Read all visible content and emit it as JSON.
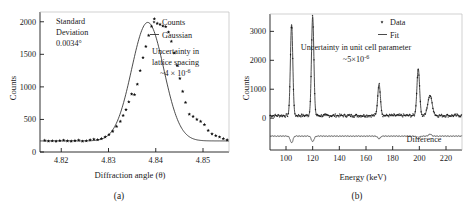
{
  "figure": {
    "panels": [
      {
        "caption": "(a)",
        "annotations": [
          {
            "name": "standard-deviation",
            "lines": [
              "Standard",
              "Deviation",
              "0.0034°"
            ]
          },
          {
            "name": "lattice-uncertainty",
            "lines": [
              "Uncertainty in",
              "lattice spacing",
              "~4 × 10",
              "-6"
            ]
          }
        ],
        "legend": [
          {
            "label": "Counts",
            "marker": "points"
          },
          {
            "label": "Gaussian",
            "marker": "line"
          }
        ]
      },
      {
        "caption": "(b)",
        "annotations": [
          {
            "name": "cell-uncertainty",
            "lines": [
              "Uncertainty in unit cell parameter",
              "~5×10",
              "-6"
            ]
          },
          {
            "name": "difference-label",
            "lines": [
              "Difference"
            ]
          }
        ],
        "legend": [
          {
            "label": "Data",
            "marker": "points"
          },
          {
            "label": "Fit",
            "marker": "line"
          }
        ]
      }
    ]
  },
  "chart_data": [
    {
      "type": "scatter",
      "panel": "(a)",
      "title": "",
      "xlabel": "Diffraction angle (θ)",
      "ylabel": "Counts",
      "xlim": [
        4.8155,
        4.8555
      ],
      "ylim": [
        0,
        2150
      ],
      "xticks": [
        4.82,
        4.83,
        4.84,
        4.85
      ],
      "xticklabels": [
        "4.82",
        "4.83",
        "4.84",
        "4.85"
      ],
      "yticks": [
        0,
        500,
        1000,
        1500,
        2000
      ],
      "yticklabels": [
        "0",
        "500",
        "1000",
        "1500",
        "2000"
      ],
      "grid": false,
      "legend_position": "top-right",
      "series": [
        {
          "name": "Counts",
          "style": "points",
          "x": [
            4.8165,
            4.8173,
            4.8181,
            4.8189,
            4.8197,
            4.8205,
            4.8213,
            4.8221,
            4.8229,
            4.8237,
            4.8245,
            4.8253,
            4.8261,
            4.8269,
            4.8277,
            4.8285,
            4.8293,
            4.8301,
            4.8309,
            4.8317,
            4.8325,
            4.8331,
            4.8337,
            4.8343,
            4.8349,
            4.8355,
            4.8361,
            4.8367,
            4.8373,
            4.8379,
            4.8385,
            4.8391,
            4.8397,
            4.8403,
            4.8409,
            4.8415,
            4.8421,
            4.8427,
            4.8433,
            4.8439,
            4.8445,
            4.8451,
            4.8457,
            4.8463,
            4.8471,
            4.8479,
            4.8487,
            4.8495,
            4.8503,
            4.8511,
            4.8519,
            4.8527,
            4.8535,
            4.8543,
            4.8551
          ],
          "y": [
            178,
            168,
            172,
            165,
            175,
            180,
            170,
            166,
            174,
            182,
            165,
            172,
            186,
            196,
            188,
            205,
            232,
            268,
            318,
            392,
            470,
            560,
            650,
            770,
            890,
            880,
            1040,
            1250,
            1450,
            1620,
            1790,
            1930,
            2045,
            1975,
            1960,
            1935,
            1925,
            1840,
            1700,
            1520,
            1330,
            1130,
            930,
            760,
            580,
            545,
            500,
            470,
            420,
            330,
            278,
            250,
            230,
            205,
            185
          ]
        },
        {
          "name": "Gaussian",
          "style": "line",
          "baseline": 170,
          "amplitude": 1820,
          "center": 4.8383,
          "sigma": 0.0034
        }
      ]
    },
    {
      "type": "line",
      "panel": "(b)",
      "title": "",
      "xlabel": "Energy (keV)",
      "ylabel": "Counts",
      "xlim": [
        88,
        232
      ],
      "ylim": [
        -1100,
        3600
      ],
      "xticks": [
        100,
        120,
        140,
        160,
        180,
        200,
        220
      ],
      "xticklabels": [
        "100",
        "120",
        "140",
        "160",
        "180",
        "200",
        "220"
      ],
      "yticks": [
        0,
        1000,
        2000,
        3000
      ],
      "yticklabels": [
        "0",
        "1000",
        "2000",
        "3000"
      ],
      "grid": false,
      "legend_position": "top-right",
      "baseline": 90,
      "difference_level": -620,
      "peaks": [
        {
          "energy": 104.2,
          "height": 3150,
          "width": 0.9
        },
        {
          "energy": 120.0,
          "height": 3420,
          "width": 0.9
        },
        {
          "energy": 169.8,
          "height": 1080,
          "width": 1.0
        },
        {
          "energy": 199.2,
          "height": 1620,
          "width": 1.0
        },
        {
          "energy": 208.0,
          "height": 700,
          "width": 1.6
        }
      ],
      "difference_peaks": [
        {
          "energy": 104.2,
          "height": -230
        },
        {
          "energy": 120.0,
          "height": -190
        },
        {
          "energy": 169.8,
          "height": -90
        },
        {
          "energy": 199.2,
          "height": -110
        },
        {
          "energy": 208.0,
          "height": 70
        }
      ],
      "series": [
        {
          "name": "Data",
          "style": "points"
        },
        {
          "name": "Fit",
          "style": "line"
        },
        {
          "name": "Difference",
          "style": "line"
        }
      ]
    }
  ]
}
